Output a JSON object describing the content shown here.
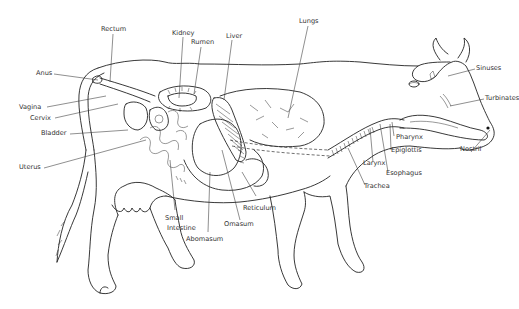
{
  "figure": {
    "labels": {
      "rectum": "Rectum",
      "kidney": "Kidney",
      "rumen": "Rumen",
      "liver": "Liver",
      "lungs": "Lungs",
      "anus": "Anus",
      "vagina": "Vagina",
      "cervix": "Cervix",
      "bladder": "Bladder",
      "uterus": "Uterus",
      "sinuses": "Sinuses",
      "turbinates": "Turbinates",
      "pharynx": "Pharynx",
      "epiglottis": "Epiglottis",
      "nostril": "Nostril",
      "larynx": "Larynx",
      "esophagus": "Esophagus",
      "trachea": "Trachea",
      "small_intestine_1": "Small",
      "small_intestine_2": "Intestine",
      "abomasum": "Abomasum",
      "omasum": "Omasum",
      "reticulum": "Reticulum"
    },
    "colors": {
      "line": "#222222",
      "text": "#333333",
      "background": "#ffffff"
    }
  }
}
